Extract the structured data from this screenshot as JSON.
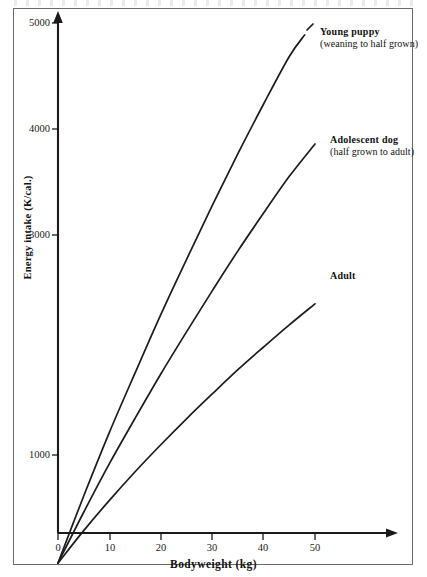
{
  "chart_data": {
    "type": "line",
    "title": "",
    "xlabel": "Bodyweight (kg)",
    "ylabel": "Energy intake  (K/cal.)",
    "xlim": [
      0,
      65
    ],
    "ylim": [
      0,
      5200
    ],
    "xticks": [
      0,
      10,
      20,
      30,
      40,
      50
    ],
    "xtick_labels": [
      "0",
      "10",
      "20",
      "30",
      "40",
      "50"
    ],
    "yticks": [
      1000,
      3000,
      4000,
      5000
    ],
    "ytick_labels": [
      "1000",
      "3000",
      "4000",
      "5000"
    ],
    "grid": false,
    "legend_position": "inline-right",
    "series": [
      {
        "name": "Young puppy",
        "sublabel": "(weaning to half grown)",
        "x": [
          0,
          5,
          10,
          15,
          20,
          25,
          30,
          35,
          40,
          45,
          48
        ],
        "values": [
          0,
          620,
          1210,
          1760,
          2300,
          2810,
          3310,
          3790,
          4250,
          4690,
          4890
        ]
      },
      {
        "name": "Adolescent dog",
        "sublabel": "(half grown to adult)",
        "x": [
          0,
          5,
          10,
          15,
          20,
          25,
          30,
          35,
          40,
          45,
          50
        ],
        "values": [
          0,
          470,
          920,
          1340,
          1750,
          2140,
          2520,
          2890,
          3240,
          3580,
          3880
        ]
      },
      {
        "name": "Adult",
        "sublabel": "",
        "x": [
          0,
          5,
          10,
          15,
          20,
          25,
          30,
          35,
          40,
          45,
          50
        ],
        "values": [
          0,
          300,
          580,
          845,
          1095,
          1335,
          1565,
          1790,
          2000,
          2205,
          2400
        ]
      }
    ],
    "colors": {
      "line": "#1c1c1c",
      "axis": "#1a1a1a",
      "text": "#111111",
      "frame": "#6a6a6a",
      "background": "#ffffff"
    }
  },
  "axis": {
    "x_title": "Bodyweight (kg)",
    "y_title": "Energy intake  (K/cal.)",
    "xticks": [
      {
        "label": "0",
        "px": 58
      },
      {
        "label": "10",
        "px": 110
      },
      {
        "label": "20",
        "px": 161
      },
      {
        "label": "30",
        "px": 212
      },
      {
        "label": "40",
        "px": 263
      },
      {
        "label": "50",
        "px": 315
      }
    ],
    "yticks": [
      {
        "label": "5000",
        "py": 23
      },
      {
        "label": "4000",
        "py": 129
      },
      {
        "label": "3000",
        "py": 235
      },
      {
        "label": "1000",
        "py": 455
      }
    ]
  },
  "labels": {
    "young_puppy": {
      "name": "Young puppy",
      "sub": "(weaning to half grown)"
    },
    "adolescent_dog": {
      "name": "Adolescent dog",
      "sub": "(half grown to adult)"
    },
    "adult": {
      "name": "Adult",
      "sub": ""
    }
  }
}
